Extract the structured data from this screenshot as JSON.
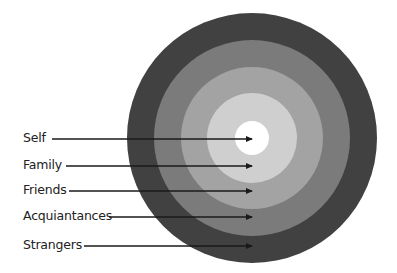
{
  "diagram": {
    "center": {
      "x": 252,
      "y": 138
    },
    "rings": [
      {
        "name": "Strangers",
        "radius": 125,
        "color": "#414141"
      },
      {
        "name": "Acquiantances",
        "radius": 98,
        "color": "#7b7b7b"
      },
      {
        "name": "Friends",
        "radius": 71,
        "color": "#a3a3a3"
      },
      {
        "name": "Family",
        "radius": 45,
        "color": "#cfcfcf"
      },
      {
        "name": "Self",
        "radius": 17,
        "color": "#ffffff"
      }
    ],
    "labels": [
      {
        "text": "Self",
        "x": 23,
        "y": 139,
        "line_start": 52
      },
      {
        "text": "Family",
        "x": 23,
        "y": 166,
        "line_start": 66
      },
      {
        "text": "Friends",
        "x": 23,
        "y": 191,
        "line_start": 69
      },
      {
        "text": "Acquiantances",
        "x": 23,
        "y": 217,
        "line_start": 109
      },
      {
        "text": "Strangers",
        "x": 23,
        "y": 246,
        "line_start": 84
      }
    ],
    "arrow_tip_x": 253,
    "arrow_color": "#1a1a1a"
  }
}
